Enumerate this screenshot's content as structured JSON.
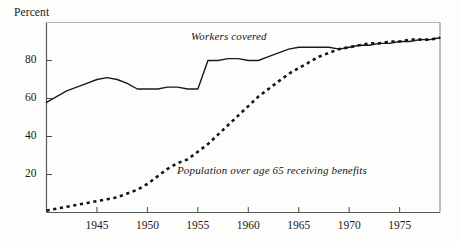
{
  "chart_data": {
    "type": "line",
    "title": "",
    "ylabel": "Percent",
    "xlabel": "",
    "ylim": [
      0,
      100
    ],
    "xlim": [
      1940,
      1979
    ],
    "grid": false,
    "legend_position": "inline-annotations",
    "yticks": [
      20,
      40,
      60,
      80
    ],
    "ytick_labels": [
      "20",
      "40",
      "60",
      "80"
    ],
    "xticks": [
      1945,
      1950,
      1955,
      1960,
      1965,
      1970,
      1975
    ],
    "xtick_labels": [
      "1945",
      "1950",
      "1955",
      "1960",
      "1965",
      "1970",
      "1975"
    ],
    "series": [
      {
        "name": "Workers covered",
        "style": "solid",
        "color": "#1a1a1a",
        "x": [
          1940,
          1941,
          1942,
          1943,
          1944,
          1945,
          1946,
          1947,
          1948,
          1949,
          1950,
          1951,
          1952,
          1953,
          1954,
          1955,
          1956,
          1957,
          1958,
          1959,
          1960,
          1961,
          1962,
          1963,
          1964,
          1965,
          1966,
          1967,
          1968,
          1969,
          1970,
          1971,
          1972,
          1973,
          1974,
          1975,
          1976,
          1977,
          1978,
          1979
        ],
        "values": [
          58,
          61,
          64,
          66,
          68,
          70,
          71,
          70,
          68,
          65,
          65,
          65,
          66,
          66,
          65,
          65,
          80,
          80,
          81,
          81,
          80,
          80,
          82,
          84,
          86,
          87,
          87,
          87,
          87,
          86,
          87,
          88,
          88,
          89,
          89,
          90,
          90,
          91,
          91,
          92
        ]
      },
      {
        "name": "Population over age 65 receiving benefits",
        "style": "dashed",
        "color": "#141414",
        "x": [
          1940,
          1941,
          1942,
          1943,
          1944,
          1945,
          1946,
          1947,
          1948,
          1949,
          1950,
          1951,
          1952,
          1953,
          1954,
          1955,
          1956,
          1957,
          1958,
          1959,
          1960,
          1961,
          1962,
          1963,
          1964,
          1965,
          1966,
          1967,
          1968,
          1969,
          1970,
          1971,
          1972,
          1973,
          1974,
          1975,
          1976,
          1977,
          1978,
          1979
        ],
        "values": [
          1,
          2,
          3,
          4,
          5,
          6,
          7,
          8,
          10,
          12,
          15,
          19,
          23,
          26,
          28,
          32,
          36,
          41,
          46,
          51,
          56,
          61,
          65,
          69,
          73,
          76,
          79,
          82,
          84,
          86,
          87,
          88,
          89,
          89,
          90,
          90,
          91,
          91,
          91,
          92
        ]
      }
    ],
    "annotations": [
      {
        "text": "Workers covered",
        "x": 1955.5,
        "y": 96,
        "style": "italic"
      },
      {
        "text": "Population over age 65 receiving benefits",
        "x": 1954,
        "y": 25,
        "style": "italic"
      }
    ]
  },
  "labels": {
    "percent": "Percent",
    "workers_covered": "Workers covered",
    "population_benefits": "Population over age 65 receiving benefits"
  }
}
